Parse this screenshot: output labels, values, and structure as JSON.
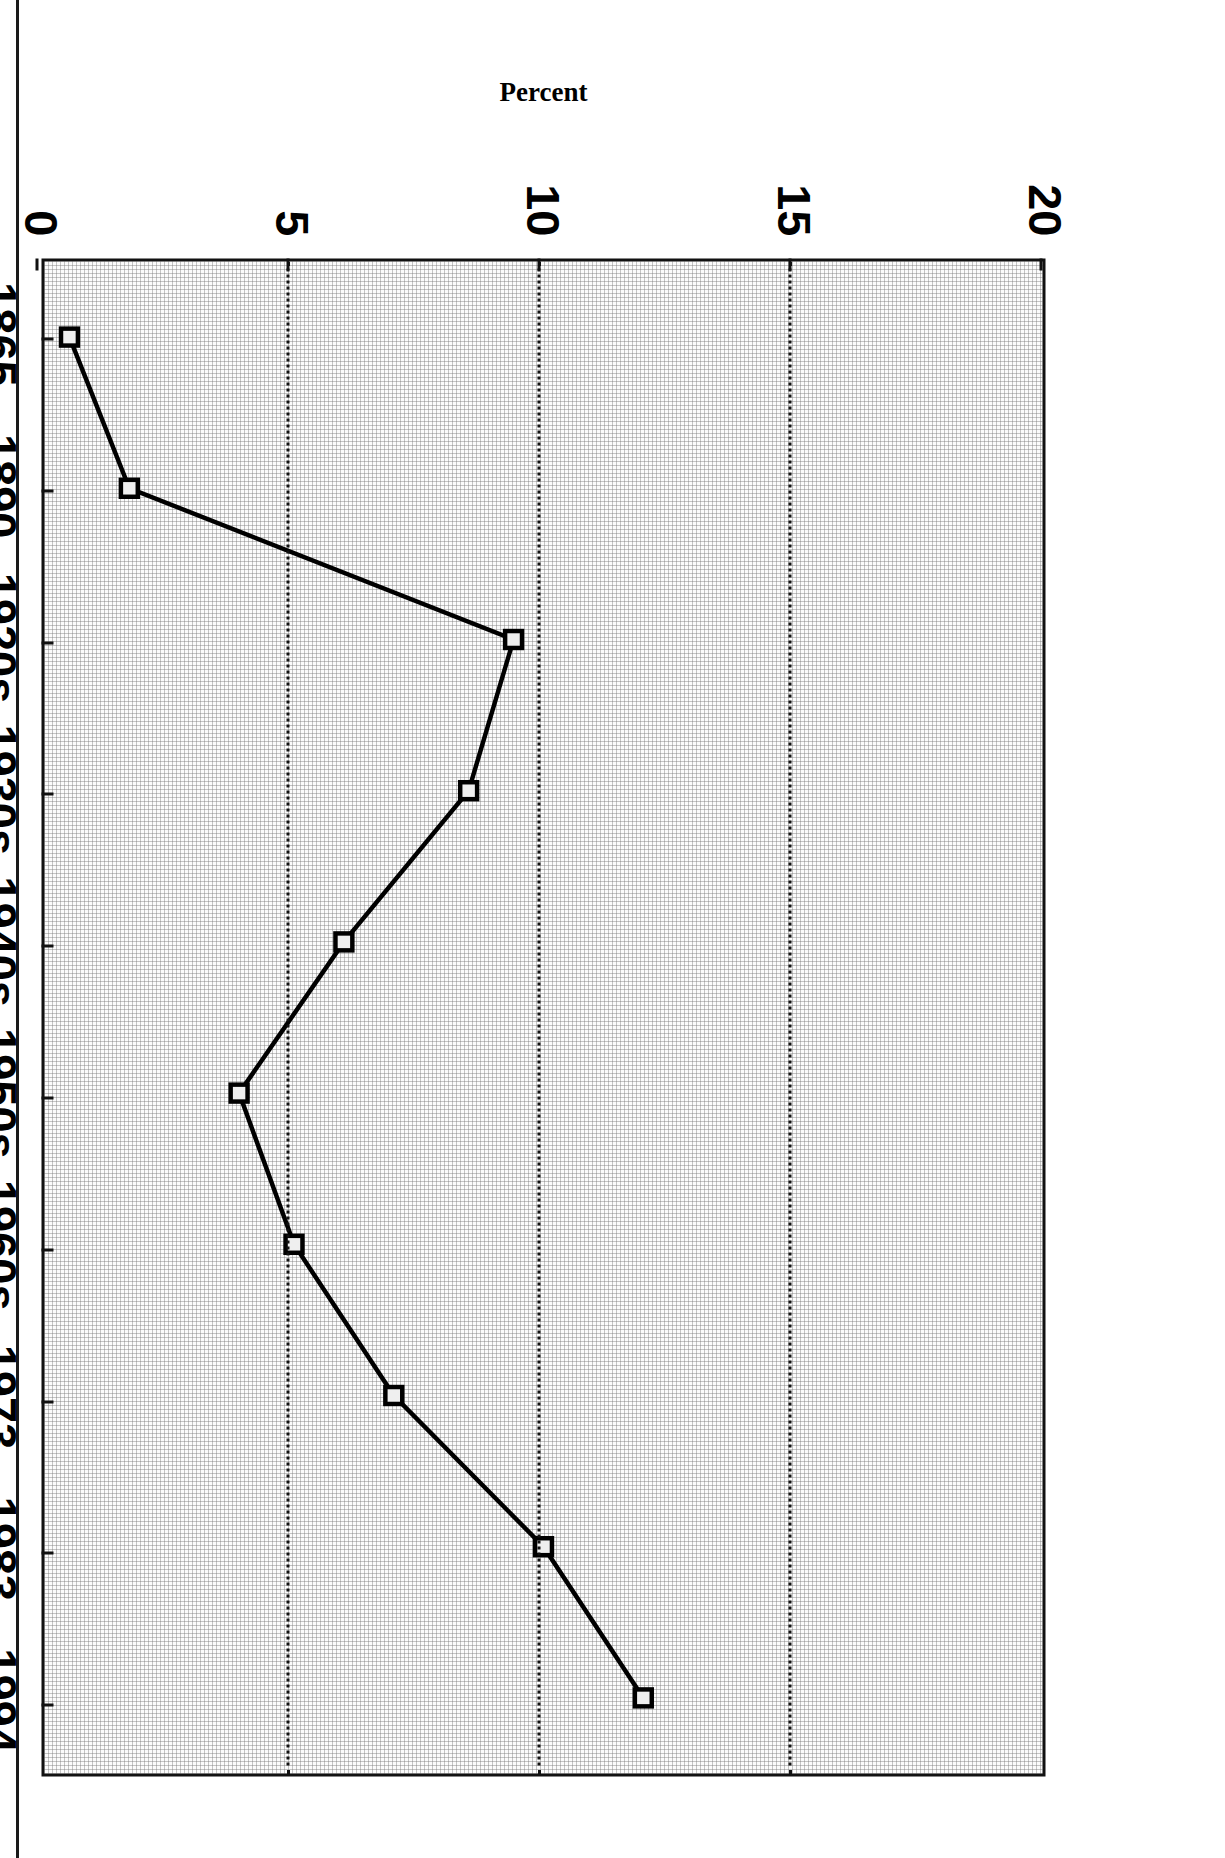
{
  "figure": {
    "axis_title_y": "Percent",
    "frame_color": "#111111",
    "series_color": "#000000",
    "plot_background": "#fbfbfb",
    "orientation_note": "landscape page rotated 90 degrees"
  },
  "chart_data": {
    "type": "line",
    "title": "",
    "subtitle": "",
    "xlabel": "",
    "ylabel": "Percent",
    "categories": [
      "1865",
      "1890",
      "1920s",
      "1930s",
      "1940s",
      "1950s",
      "1960s",
      "1973",
      "1983",
      "1994"
    ],
    "values": [
      0.5,
      1.7,
      9.4,
      8.5,
      6.0,
      3.9,
      5.0,
      7.0,
      10.0,
      12.0
    ],
    "series": [
      {
        "name": "Percent",
        "values": [
          0.5,
          1.7,
          9.4,
          8.5,
          6.0,
          3.9,
          5.0,
          7.0,
          10.0,
          12.0
        ]
      }
    ],
    "ylim": [
      0,
      20
    ],
    "ytick_labels": [
      "0",
      "5",
      "10",
      "15",
      "20"
    ],
    "ytick_values": [
      0,
      5,
      10,
      15,
      20
    ],
    "xtick_labels": [
      "1865",
      "1890",
      "1920s",
      "1930s",
      "1940s",
      "1950s",
      "1960s",
      "1973",
      "1983",
      "1994"
    ],
    "gridlines": {
      "y": [
        5,
        10,
        15
      ],
      "style": "dotted",
      "x": "none"
    },
    "legend": {
      "visible": false,
      "position": "none"
    },
    "markers": "open-square",
    "line_style": "solid"
  }
}
